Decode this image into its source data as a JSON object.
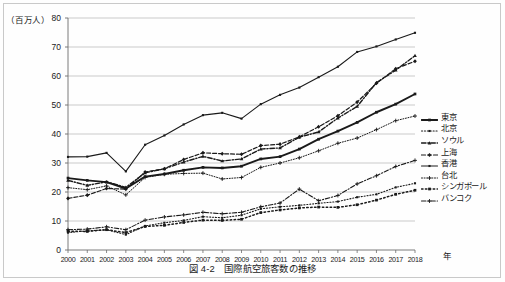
{
  "figure": {
    "caption": "図 4-2　国際航空旅客数の推移",
    "y_unit_label": "（百万人）",
    "x_unit_label": "年"
  },
  "chart_data": {
    "type": "line",
    "title": "図 4-2　国際航空旅客数の推移",
    "xlabel": "年",
    "ylabel": "（百万人）",
    "ylim": [
      0,
      80
    ],
    "ytick_labels": [
      "0",
      "10",
      "20",
      "30",
      "40",
      "50",
      "60",
      "70",
      "80"
    ],
    "yticks": [
      0,
      10,
      20,
      30,
      40,
      50,
      60,
      70,
      80
    ],
    "grid": "horizontal",
    "legend_position": "right",
    "x": [
      2000,
      2001,
      2002,
      2003,
      2004,
      2005,
      2006,
      2007,
      2008,
      2009,
      2010,
      2011,
      2012,
      2013,
      2014,
      2015,
      2016,
      2017,
      2018
    ],
    "categories": [
      "2000",
      "2001",
      "2002",
      "2003",
      "2004",
      "2005",
      "2006",
      "2007",
      "2008",
      "2009",
      "2010",
      "2011",
      "2012",
      "2013",
      "2014",
      "2015",
      "2016",
      "2017",
      "2018"
    ],
    "series": [
      {
        "name": "東京",
        "marker": "square",
        "dash": "solid",
        "width": 1.9,
        "values": [
          24.8,
          24.0,
          23.4,
          21.2,
          25.3,
          26.2,
          27.5,
          28.5,
          28.3,
          28.9,
          31.4,
          32.2,
          34.8,
          38.2,
          41.0,
          44.0,
          47.5,
          50.3,
          53.8
        ]
      },
      {
        "name": "北京",
        "marker": "square",
        "dash": "dotted",
        "width": 1.1,
        "values": [
          6.0,
          6.6,
          7.0,
          5.3,
          8.3,
          9.4,
          10.2,
          11.5,
          11.1,
          12.0,
          14.2,
          14.9,
          15.4,
          16.1,
          16.7,
          18.2,
          19.2,
          21.6,
          23.0
        ]
      },
      {
        "name": "ソウル",
        "marker": "triangle",
        "dash": "dashdot",
        "width": 1.4,
        "values": [
          24.0,
          22.3,
          23.5,
          21.6,
          26.6,
          28.0,
          30.3,
          32.3,
          30.7,
          31.4,
          34.8,
          35.2,
          38.9,
          40.7,
          45.5,
          49.5,
          57.7,
          62.0,
          67.0
        ]
      },
      {
        "name": "上海",
        "marker": "diamond",
        "dash": "dashed",
        "width": 1.2,
        "values": [
          17.8,
          18.9,
          21.2,
          21.0,
          26.9,
          28.0,
          31.2,
          33.5,
          33.2,
          33.0,
          36.0,
          36.5,
          39.0,
          42.5,
          46.3,
          51.0,
          57.5,
          62.5,
          65.1
        ]
      },
      {
        "name": "香港",
        "marker": "square",
        "dash": "solid",
        "width": 1.1,
        "values": [
          32.1,
          32.2,
          33.5,
          27.1,
          36.3,
          39.5,
          43.3,
          46.5,
          47.3,
          45.3,
          50.3,
          53.5,
          56.0,
          59.6,
          63.2,
          68.3,
          70.2,
          72.6,
          74.9
        ]
      },
      {
        "name": "台北",
        "marker": "plus",
        "dash": "dotted",
        "width": 1.0,
        "values": [
          21.5,
          20.8,
          22.1,
          19.0,
          25.0,
          26.1,
          26.4,
          26.5,
          24.5,
          25.0,
          28.5,
          30.0,
          31.8,
          34.2,
          36.8,
          38.6,
          41.5,
          44.6,
          46.2
        ]
      },
      {
        "name": "シンガポール",
        "marker": "square",
        "dash": "dotted",
        "width": 1.5,
        "values": [
          6.5,
          6.4,
          7.0,
          6.0,
          8.1,
          8.5,
          9.5,
          10.3,
          10.2,
          10.6,
          12.9,
          13.8,
          14.5,
          14.8,
          14.7,
          15.6,
          17.2,
          19.2,
          20.6
        ]
      },
      {
        "name": "バンコク",
        "marker": "plus",
        "dash": "dashdot",
        "width": 1.1,
        "values": [
          7.0,
          7.2,
          8.0,
          7.0,
          10.3,
          11.4,
          12.1,
          13.0,
          12.5,
          13.0,
          14.9,
          16.2,
          21.0,
          17.0,
          18.8,
          22.8,
          25.6,
          28.8,
          30.9
        ]
      }
    ]
  },
  "colors": {
    "line": "#1a1a1a",
    "grid": "#b6b6b6",
    "axis": "#6d6d6d",
    "background": "#fefefe",
    "frame": "#c9c9c9"
  }
}
